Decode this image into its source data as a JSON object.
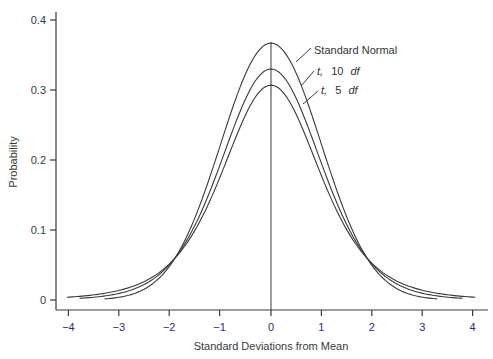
{
  "chart_data": {
    "type": "line",
    "title": "",
    "xlabel": "Standard Deviations from Mean",
    "ylabel": "Probability",
    "xlim": [
      -4,
      4
    ],
    "ylim": [
      0,
      0.4
    ],
    "x_ticks": [
      "-4",
      "-3",
      "-2",
      "-1",
      "0",
      "1",
      "2",
      "3",
      "4"
    ],
    "y_ticks": [
      "0",
      "0.1",
      "0.2",
      "0.3",
      "0.4"
    ],
    "grid": false,
    "vertical_reference_line_at_x": 0,
    "series": [
      {
        "name": "Standard Normal",
        "label_parts": [
          "Standard Normal"
        ],
        "peak": 0.367,
        "x_range": [
          -3.3,
          3.3
        ],
        "x": [
          -3,
          -2,
          -1,
          0,
          1,
          2,
          3
        ],
        "values": [
          0.004,
          0.05,
          0.223,
          0.367,
          0.223,
          0.05,
          0.004
        ]
      },
      {
        "name": "t, 10 df",
        "label_parts": [
          "t,",
          "10",
          "df"
        ],
        "peak": 0.33,
        "x_range": [
          -3.8,
          3.8
        ],
        "x": [
          -3,
          -2,
          -1,
          0,
          1,
          2,
          3
        ],
        "values": [
          0.011,
          0.061,
          0.222,
          0.33,
          0.222,
          0.061,
          0.011
        ]
      },
      {
        "name": "t, 5 df",
        "label_parts": [
          "t,",
          "5",
          "df"
        ],
        "peak": 0.307,
        "x_range": [
          -4.05,
          4.05
        ],
        "x": [
          -3,
          -2,
          -1,
          0,
          1,
          2,
          3
        ],
        "values": [
          0.016,
          0.066,
          0.22,
          0.307,
          0.22,
          0.066,
          0.016
        ]
      }
    ],
    "legend_position": "inline annotations upper-right of peak"
  }
}
